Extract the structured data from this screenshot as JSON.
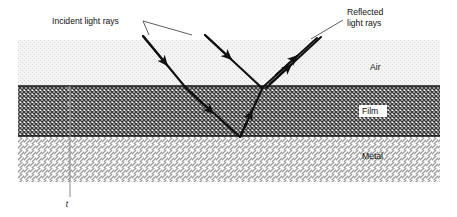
{
  "figure": {
    "width": 457,
    "height": 217,
    "background": "#ffffff"
  },
  "callouts": {
    "incident": {
      "text": "Incident light rays",
      "x": 52,
      "y": 24
    },
    "reflected": {
      "line1": "Reflected",
      "line2": "light rays",
      "x": 347,
      "y": 15
    }
  },
  "layers": [
    {
      "id": "air",
      "label": "Air",
      "y_top": 40,
      "y_bottom": 86,
      "fill": "#f2f2f2",
      "pattern": "fine-dot",
      "label_x": 370,
      "label_y": 70
    },
    {
      "id": "film",
      "label": "Film",
      "y_top": 86,
      "y_bottom": 136,
      "fill": "#8a8a8a",
      "pattern": "cross-hatch",
      "label_x": 370,
      "label_y": 114
    },
    {
      "id": "metal",
      "label": "Metal",
      "y_top": 136,
      "y_bottom": 182,
      "fill": "#ffffff",
      "pattern": "diagonal-hatch",
      "label_x": 370,
      "label_y": 159
    }
  ],
  "geometry": {
    "x_left": 18,
    "x_right": 440
  },
  "dimension": {
    "label": "t",
    "label_x": 67,
    "label_y": 207,
    "line_x": 70,
    "y_top": 86,
    "y_bottom": 182,
    "extension_y": 197,
    "color": "#8b8b8b"
  },
  "rays": {
    "stroke": "#111111",
    "incident": [
      {
        "id": "incident-ray-1",
        "x1": 143,
        "y1": 36,
        "x2": 185,
        "y2": 88
      },
      {
        "id": "incident-ray-2",
        "x1": 205,
        "y1": 35,
        "x2": 262,
        "y2": 87
      }
    ],
    "refracted": [
      {
        "id": "refracted-ray-1",
        "x1": 185,
        "y1": 88,
        "x2": 240,
        "y2": 136
      }
    ],
    "internal_reflected": [
      {
        "id": "internal-reflected-ray",
        "x1": 240,
        "y1": 136,
        "x2": 263,
        "y2": 87
      }
    ],
    "reflected": [
      {
        "id": "reflected-ray-1",
        "x1": 262,
        "y1": 87,
        "x2": 316,
        "y2": 38
      },
      {
        "id": "reflected-ray-2",
        "x1": 266,
        "y1": 87,
        "x2": 320,
        "y2": 37
      }
    ],
    "vertex_top_x": 262,
    "vertex_top_y": 87,
    "vertex_bottom_x": 240,
    "vertex_bottom_y": 136
  },
  "leaders": {
    "stroke": "#333333",
    "lines": [
      {
        "id": "incident-leader-1",
        "x1": 143,
        "y1": 21,
        "x2": 190,
        "y2": 35
      },
      {
        "id": "incident-leader-2",
        "x1": 143,
        "y1": 21,
        "x2": 150,
        "y2": 35
      },
      {
        "id": "reflected-leader-1",
        "x1": 343,
        "y1": 20,
        "x2": 312,
        "y2": 38
      }
    ]
  },
  "colors": {
    "ink": "#111111",
    "air_fill": "#f2f2f2",
    "film_fill": "#8a8a8a",
    "dimension_gray": "#8b8b8b"
  }
}
